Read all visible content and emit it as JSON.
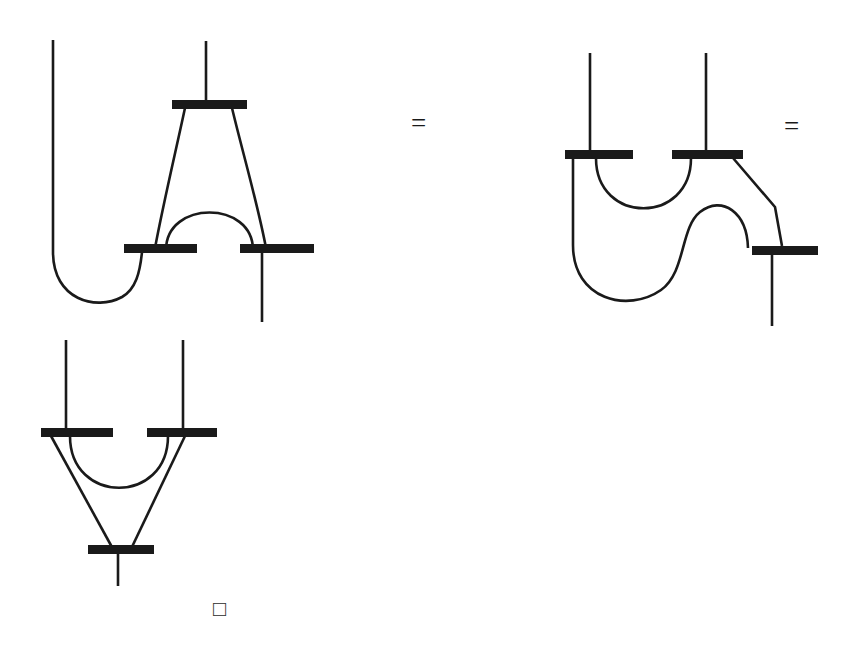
{
  "figure": {
    "type": "string-diagram-equation",
    "stroke_color": "#1a1a1a",
    "background_color": "#ffffff",
    "bar_color": "#1a1a1a",
    "wire_width": 2.6,
    "bar_height": 9,
    "symbols": {
      "equals_1": "=",
      "equals_2": "=",
      "qed": "□"
    },
    "diagrams": [
      {
        "id": "diagram-lhs",
        "name": "left-hand-side-diagram",
        "label": "",
        "bars": [
          {
            "name": "bar-top",
            "x1": 172,
            "x2": 247,
            "y": 104
          },
          {
            "name": "bar-bottom-left",
            "x1": 124,
            "x2": 197,
            "y": 248
          },
          {
            "name": "bar-bottom-right",
            "x1": 240,
            "x2": 314,
            "y": 248
          }
        ],
        "wires": [
          {
            "name": "wire-input-top",
            "kind": "straight-leg"
          },
          {
            "name": "wire-left-outer-u",
            "kind": "cup"
          },
          {
            "name": "wire-left-diagonal",
            "kind": "diagonal"
          },
          {
            "name": "wire-right-diagonal",
            "kind": "diagonal"
          },
          {
            "name": "wire-inner-cap",
            "kind": "cap"
          },
          {
            "name": "wire-output-bottom",
            "kind": "straight-leg"
          }
        ]
      },
      {
        "id": "diagram-rhs",
        "name": "right-hand-side-diagram",
        "label": "",
        "bars": [
          {
            "name": "bar-top-left",
            "x1": 565,
            "x2": 633,
            "y": 154
          },
          {
            "name": "bar-top-right",
            "x1": 672,
            "x2": 743,
            "y": 154
          },
          {
            "name": "bar-bottom-right",
            "x1": 752,
            "x2": 818,
            "y": 250
          }
        ],
        "wires": [
          {
            "name": "wire-input-left",
            "kind": "straight-leg"
          },
          {
            "name": "wire-input-right",
            "kind": "straight-leg"
          },
          {
            "name": "wire-left-cap",
            "kind": "cap"
          },
          {
            "name": "wire-s-bend",
            "kind": "s-curve"
          },
          {
            "name": "wire-right-diagonal",
            "kind": "diagonal"
          },
          {
            "name": "wire-output-bottom",
            "kind": "straight-leg"
          }
        ]
      },
      {
        "id": "diagram-second-row",
        "name": "second-row-diagram",
        "label": "",
        "bars": [
          {
            "name": "bar-top-left",
            "x1": 41,
            "x2": 113,
            "y": 432
          },
          {
            "name": "bar-top-right",
            "x1": 147,
            "x2": 217,
            "y": 432
          },
          {
            "name": "bar-bottom",
            "x1": 88,
            "x2": 154,
            "y": 549
          }
        ],
        "wires": [
          {
            "name": "wire-input-left",
            "kind": "straight-leg"
          },
          {
            "name": "wire-input-right",
            "kind": "straight-leg"
          },
          {
            "name": "wire-inner-cup",
            "kind": "cup"
          },
          {
            "name": "wire-left-diagonal",
            "kind": "diagonal"
          },
          {
            "name": "wire-right-diagonal",
            "kind": "diagonal"
          },
          {
            "name": "wire-output-bottom",
            "kind": "straight-leg"
          }
        ]
      }
    ]
  }
}
